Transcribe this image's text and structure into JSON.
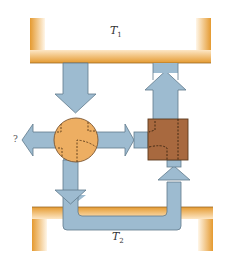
{
  "diagram": {
    "reservoirs": {
      "hot": {
        "label": "T",
        "subscript": "1",
        "color": "#E9A23B"
      },
      "cold": {
        "label": "T",
        "subscript": "2",
        "color": "#E9A23B"
      }
    },
    "engine": {
      "shape": "circle",
      "color": "#EDAE62"
    },
    "refrigerator": {
      "shape": "square",
      "color": "#A8693F"
    },
    "unknown_output_label": "?",
    "arrow_color": "#9DBBD0",
    "arrow_stroke": "#5F7A8C"
  }
}
